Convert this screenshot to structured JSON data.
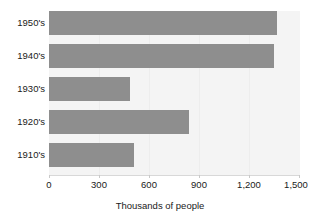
{
  "chart_data": {
    "type": "bar",
    "orientation": "horizontal",
    "title": "",
    "subtitle": "",
    "categories": [
      "1950's",
      "1940's",
      "1930's",
      "1920's",
      "1910's"
    ],
    "values": [
      1365,
      1345,
      485,
      835,
      505
    ],
    "series": [
      {
        "name": "",
        "values": [
          1365,
          1345,
          485,
          835,
          505
        ]
      }
    ],
    "xlabel": "Thousands of people",
    "ylabel": "",
    "xlim": [
      0,
      1500
    ],
    "xticks": [
      0,
      300,
      600,
      900,
      1200,
      1500
    ],
    "xtick_labels": [
      "0",
      "300",
      "600",
      "900",
      "1,200",
      "1,500"
    ],
    "grid": false,
    "legend": false,
    "legend_position": "none",
    "annotations": [],
    "colors": {
      "bar": "#8e8e8e",
      "plot_background": "#f4f4f4",
      "page_background": "#ffffff",
      "axis_line": "#d8d8d8",
      "text": "#1a1a1a"
    }
  }
}
